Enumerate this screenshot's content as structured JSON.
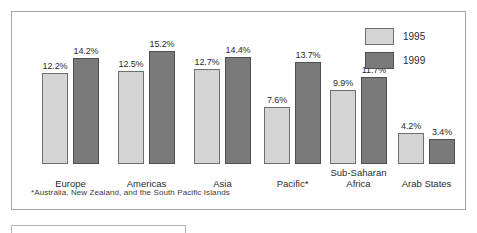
{
  "legend": {
    "position": "top-right",
    "entries": [
      {
        "label": "1995",
        "color": "#d4d4d4",
        "swatch_name": "legend-swatch-1995"
      },
      {
        "label": "1999",
        "color": "#7a7a7a",
        "swatch_name": "legend-swatch-1999"
      }
    ]
  },
  "footnote": {
    "text": "*Australia, New Zealand, and the South Pacific Islands"
  },
  "chart_data": {
    "type": "bar",
    "title": "",
    "subtitle": "",
    "xlabel": "",
    "ylabel": "",
    "ylim": [
      0,
      15.2
    ],
    "grid": false,
    "legend_position": "top-right",
    "value_suffix": "%",
    "categories": [
      "Europe",
      "Americas",
      "Asia",
      "Pacific*",
      "Sub-Saharan\nAfrica",
      "Arab States"
    ],
    "series": [
      {
        "name": "1995",
        "color": "#d4d4d4",
        "values": [
          12.2,
          12.5,
          12.7,
          7.6,
          9.9,
          4.2
        ],
        "labels": [
          "12.2%",
          "12.5%",
          "12.7%",
          "7.6%",
          "9.9%",
          "4.2%"
        ]
      },
      {
        "name": "1999",
        "color": "#7a7a7a",
        "values": [
          14.2,
          15.2,
          14.4,
          13.7,
          11.7,
          3.4
        ],
        "labels": [
          "14.2%",
          "15.2%",
          "14.4%",
          "13.7%",
          "11.7%",
          "3.4%"
        ]
      }
    ],
    "annotations": [
      "*Australia, New Zealand, and the South Pacific Islands"
    ]
  }
}
